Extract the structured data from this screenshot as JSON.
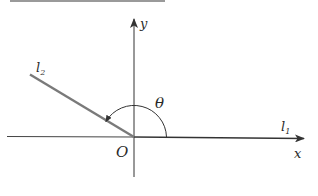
{
  "diagram": {
    "type": "inclination-angle",
    "axes": {
      "x_label": "x",
      "y_label": "y",
      "origin_label": "O"
    },
    "lines": [
      {
        "name": "l1",
        "label_base": "l",
        "label_sub": "1",
        "direction": "along positive x-axis"
      },
      {
        "name": "l2",
        "label_base": "l",
        "label_sub": "2",
        "direction": "upper-left from origin"
      }
    ],
    "angle": {
      "label": "θ",
      "from": "l1",
      "to": "l2",
      "approx_degrees": 152
    },
    "colors": {
      "axis": "#333333",
      "line_l2": "#7a7a7a",
      "text": "#2a2a2a",
      "top_border": "#9a9a9a"
    }
  }
}
